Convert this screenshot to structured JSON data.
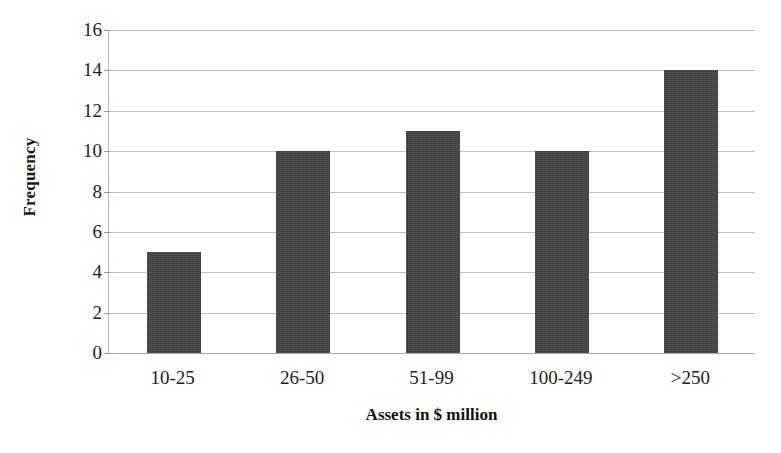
{
  "chart_data": {
    "type": "bar",
    "title": "",
    "subtitle": "",
    "categories": [
      "10-25",
      "26-50",
      "51-99",
      "100-249",
      ">250"
    ],
    "values": [
      5,
      10,
      11,
      10,
      14
    ],
    "series": [
      {
        "name": "Frequency",
        "values": [
          5,
          10,
          11,
          10,
          14
        ]
      }
    ],
    "xlabel": "Assets in $ million",
    "ylabel": "Frequency",
    "ylim": [
      0,
      16
    ],
    "yticks": [
      0,
      2,
      4,
      6,
      8,
      10,
      12,
      14,
      16
    ],
    "ytick_labels": [
      "0",
      "2",
      "4",
      "6",
      "8",
      "10",
      "12",
      "14",
      "16"
    ],
    "grid": true,
    "grid_axis": "y",
    "legend": false,
    "legend_position": "none",
    "bar_color": "#3b3b3b",
    "background_color": "#ffffff",
    "gridline_color": "#c0c0c0",
    "axis_color": "#a8a8a8"
  }
}
